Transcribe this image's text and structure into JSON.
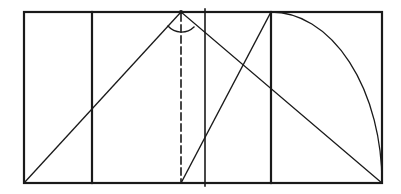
{
  "diagram": {
    "title": "",
    "stroke_color": "#1a1a1a",
    "background": "#ffffff",
    "outer_rect": {
      "x1": 24,
      "y1": 12,
      "x2": 382,
      "y2": 183
    },
    "vertical_lines": [
      {
        "name": "divider-1",
        "x": 92,
        "y1": 12,
        "y2": 183
      },
      {
        "name": "divider-2",
        "x": 205,
        "y1": 9,
        "y2": 186
      },
      {
        "name": "divider-3",
        "x": 271,
        "y1": 12,
        "y2": 183
      }
    ],
    "dashed_line": {
      "x": 181,
      "y1": 12,
      "y2": 183
    },
    "apex": {
      "x": 181,
      "y": 12
    },
    "diagonals": [
      {
        "name": "left-diagonal",
        "x1": 24,
        "y1": 183,
        "x2": 181,
        "y2": 12
      },
      {
        "name": "right-diagonal",
        "x1": 181,
        "y1": 12,
        "x2": 382,
        "y2": 183
      },
      {
        "name": "inner-diagonal",
        "x1": 181,
        "y1": 183,
        "x2": 271,
        "y2": 12
      }
    ],
    "arc": {
      "cx": 271,
      "cy": 183,
      "r": 111
    },
    "angle_arc": {
      "cx": 181,
      "cy": 12,
      "r": 18
    }
  }
}
